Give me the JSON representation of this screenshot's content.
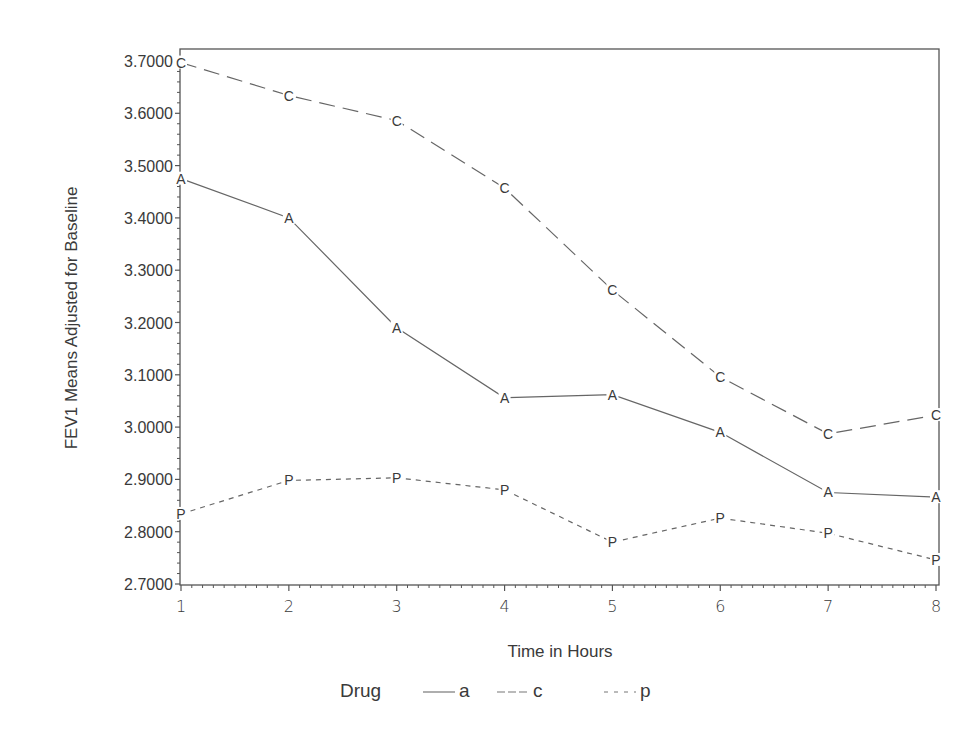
{
  "chart_data": {
    "type": "line",
    "title": "",
    "xlabel": "Time in Hours",
    "ylabel": "FEV1 Means Adjusted for Baseline",
    "x": [
      1,
      2,
      3,
      4,
      5,
      6,
      7,
      8
    ],
    "xticks": [
      "1",
      "2",
      "3",
      "4",
      "5",
      "6",
      "7",
      "8"
    ],
    "xlim": [
      1,
      8
    ],
    "ylim": [
      2.7,
      3.7
    ],
    "yticks": [
      "2.7000",
      "2.8000",
      "2.9000",
      "3.0000",
      "3.1000",
      "3.2000",
      "3.3000",
      "3.4000",
      "3.5000",
      "3.6000",
      "3.7000"
    ],
    "grid": false,
    "legend_title": "Drug",
    "legend_position": "bottom",
    "series": [
      {
        "name": "a",
        "marker": "A",
        "style": "solid",
        "values": [
          3.475,
          3.4,
          3.19,
          3.056,
          3.062,
          2.99,
          2.875,
          2.866
        ]
      },
      {
        "name": "c",
        "marker": "C",
        "style": "long-dash",
        "values": [
          3.697,
          3.634,
          3.586,
          3.457,
          3.262,
          3.096,
          2.987,
          3.023
        ]
      },
      {
        "name": "p",
        "marker": "P",
        "style": "short-dash",
        "values": [
          2.834,
          2.898,
          2.903,
          2.88,
          2.78,
          2.826,
          2.797,
          2.746
        ]
      }
    ]
  }
}
